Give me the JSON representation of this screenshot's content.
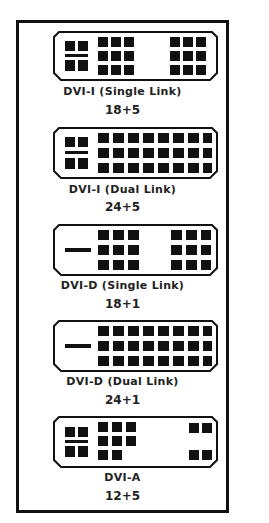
{
  "connectors": [
    {
      "name": "DVI-I (Single Link)",
      "pins": "18+5"
    },
    {
      "name": "DVI-I (Dual Link)",
      "pins": "24+5"
    },
    {
      "name": "DVI-D (Single Link)",
      "pins": "18+1"
    },
    {
      "name": "DVI-D (Dual Link)",
      "pins": "24+1"
    },
    {
      "name": "DVI-A",
      "pins": "12+5"
    }
  ],
  "colors": {
    "pin": "#111111",
    "outline": "#111111",
    "background": "#ffffff",
    "text": "#222222"
  }
}
